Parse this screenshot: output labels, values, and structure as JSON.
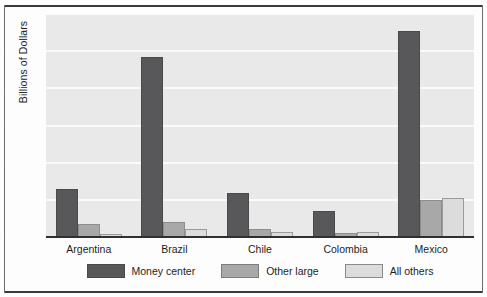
{
  "chart_data": {
    "type": "bar",
    "title": "",
    "xlabel": "",
    "ylabel": "Billions of Dollars",
    "ylim": [
      0,
      12
    ],
    "yticks": [
      0,
      2,
      4,
      6,
      8,
      10,
      12
    ],
    "grid": true,
    "legend_position": "bottom",
    "categories": [
      "Argentina",
      "Brazil",
      "Chile",
      "Colombia",
      "Mexico"
    ],
    "series": [
      {
        "name": "Money center",
        "color": "#58585A",
        "values": [
          2.6,
          9.7,
          2.35,
          1.4,
          11.1
        ]
      },
      {
        "name": "Other large",
        "color": "#A8A8A8",
        "values": [
          0.7,
          0.8,
          0.45,
          0.2,
          2.0
        ]
      },
      {
        "name": "All others",
        "color": "#DCDCDC",
        "values": [
          0.15,
          0.45,
          0.25,
          0.25,
          2.1
        ]
      }
    ]
  }
}
